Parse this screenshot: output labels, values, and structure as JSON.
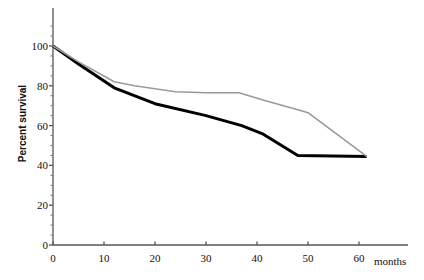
{
  "chart_data": {
    "type": "line",
    "title": "",
    "xlabel": "months",
    "ylabel": "Percent survival",
    "xlim": [
      0,
      66
    ],
    "ylim": [
      0,
      112
    ],
    "grid": false,
    "legend": "none",
    "xticks": [
      0,
      10,
      20,
      30,
      40,
      50,
      60
    ],
    "xtick_labels": [
      "0",
      "10",
      "20",
      "30",
      "40",
      "50",
      "60"
    ],
    "yticks": [
      0,
      20,
      40,
      60,
      80,
      100
    ],
    "ytick_labels": [
      "0",
      "20",
      "40",
      "60",
      "80",
      "100"
    ],
    "y_minor_tick_step": 5,
    "series": [
      {
        "name": "black-curve",
        "color": "#000000",
        "width": 3.0,
        "x": [
          0,
          5,
          12,
          20,
          30,
          37,
          41,
          48,
          61.5
        ],
        "values": [
          100,
          91,
          79,
          71,
          65,
          60,
          56,
          45,
          44.5
        ]
      },
      {
        "name": "gray-curve",
        "color": "#9a9a9a",
        "width": 1.6,
        "x": [
          0,
          5,
          12,
          16,
          24,
          30,
          36.5,
          41,
          48,
          50,
          61.5
        ],
        "values": [
          100,
          92,
          82,
          80,
          77,
          76.5,
          76.5,
          73,
          68,
          66.5,
          44.5
        ]
      }
    ]
  },
  "axes": {
    "y_axis_name": "y-axis",
    "x_axis_name": "x-axis"
  }
}
